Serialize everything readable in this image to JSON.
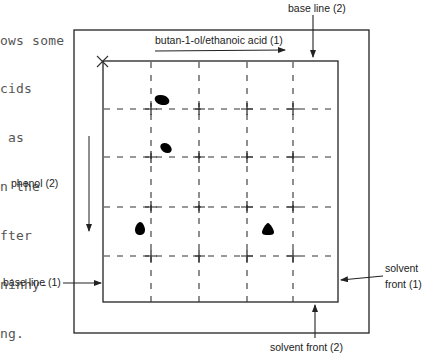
{
  "caption_fragment": {
    "lines": [
      "ows some",
      "cids",
      " as",
      "n the",
      "fter",
      "ninhy-",
      "ng."
    ]
  },
  "diagram": {
    "type": "two-dimensional paper chromatogram",
    "labels": {
      "solvent1_direction": "butan-1-ol/ethanoic acid (1)",
      "solvent2_direction": "phenol (2)",
      "base_line_1": "base line (1)",
      "base_line_2": "base line (2)",
      "solvent_front_1_line1": "solvent",
      "solvent_front_1_line2": "front (1)",
      "solvent_front_2": "solvent front (2)"
    },
    "origin_marker": "×",
    "grid": {
      "columns": 5,
      "rows": 5,
      "style": "dashed"
    },
    "spots": [
      {
        "id": 1,
        "cx": 162,
        "cy": 100,
        "shape": "oval"
      },
      {
        "id": 2,
        "cx": 166,
        "cy": 148,
        "shape": "oval"
      },
      {
        "id": 3,
        "cx": 140,
        "cy": 228,
        "shape": "drop"
      },
      {
        "id": 4,
        "cx": 268,
        "cy": 229,
        "shape": "drop"
      }
    ],
    "colors": {
      "line": "#222222",
      "spot": "#000000",
      "background": "#ffffff"
    }
  }
}
